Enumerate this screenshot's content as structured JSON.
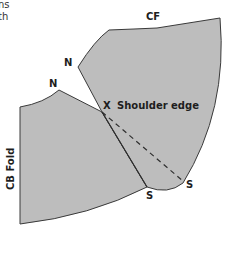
{
  "caption_fragment": [
    "ns",
    "th"
  ],
  "pieces": {
    "front": {
      "name": "front-pattern-piece"
    },
    "back": {
      "name": "back-pattern-piece"
    }
  },
  "labels": {
    "cf": "CF",
    "n_front": "N",
    "n_back": "N",
    "x_marker": "X",
    "shoulder_edge": "Shoulder edge",
    "s_dashed": "S",
    "s_side": "S",
    "cb_fold": "CB Fold"
  },
  "colors": {
    "piece_fill": "#bdbdbd",
    "outline": "#3a3a3a",
    "text": "#1e1e1e"
  }
}
